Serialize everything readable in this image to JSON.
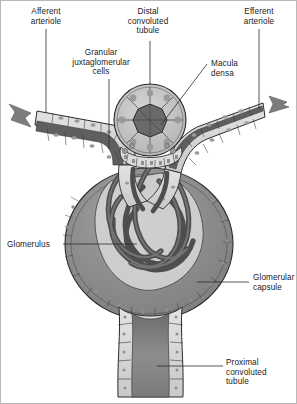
{
  "figure": {
    "style": "grayscale line drawing with frame border"
  },
  "labels": {
    "afferent_arteriole": "Afferent\narteriole",
    "distal_convoluted_tubule": "Distal\nconvoluted\ntubule",
    "efferent_arteriole": "Efferent\narteriole",
    "granular_juxtaglomerular_cells": "Granular\njuxtaglomerular\ncells",
    "macula_densa": "Macula\ndensa",
    "glomerulus": "Glomerulus",
    "glomerular_capsule": "Glomerular\ncapsule",
    "proximal_convoluted_tubule": "Proximal\nconvoluted\ntubule"
  },
  "icons": {
    "inflow_arrow": "blood-inflow-arrow",
    "outflow_arrow": "blood-outflow-arrow"
  },
  "colors": {
    "outline": "#2b2b2b",
    "leader_line": "#2b2b2b",
    "text": "#1b1b1b",
    "cell_fill": "#d9d9d9",
    "cell_nucleus": "#9a9a9a",
    "vessel_lumen": "#5f5f5f",
    "capsular_space": "#8f8f8f",
    "capillary_tuft": "#6a6a6a",
    "arrow_gray": "#7d7d7d",
    "tubule_lumen": "#8a8a8a",
    "background": "#ffffff"
  }
}
